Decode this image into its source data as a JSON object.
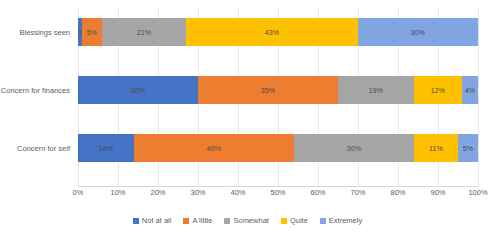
{
  "chart_data": {
    "type": "bar",
    "subtype": "stacked-horizontal-100pct",
    "title": "",
    "xlabel": "",
    "ylabel": "",
    "xlim": [
      0,
      100
    ],
    "grid": true,
    "legend_position": "bottom",
    "categories": [
      "Blessings seen",
      "Concern for finances",
      "Concern for self"
    ],
    "tick_labels": [
      "0%",
      "10%",
      "20%",
      "30%",
      "40%",
      "50%",
      "60%",
      "70%",
      "80%",
      "90%",
      "100%"
    ],
    "tick_values": [
      0,
      10,
      20,
      30,
      40,
      50,
      60,
      70,
      80,
      90,
      100
    ],
    "series": [
      {
        "name": "Not at all",
        "color": "#4472c4",
        "values": [
          1,
          30,
          14
        ],
        "labels": [
          "1%",
          "30%",
          "14%"
        ]
      },
      {
        "name": "A little",
        "color": "#ed7d31",
        "values": [
          5,
          35,
          40
        ],
        "labels": [
          "5%",
          "35%",
          "40%"
        ]
      },
      {
        "name": "Somewhat",
        "color": "#a5a5a5",
        "values": [
          21,
          19,
          30
        ],
        "labels": [
          "21%",
          "19%",
          "30%"
        ]
      },
      {
        "name": "Quite",
        "color": "#ffc000",
        "values": [
          43,
          12,
          11
        ],
        "labels": [
          "43%",
          "12%",
          "11%"
        ]
      },
      {
        "name": "Extremely",
        "color": "#80a5e0",
        "values": [
          30,
          4,
          5
        ],
        "labels": [
          "30%",
          "4%",
          "5%"
        ]
      }
    ]
  }
}
